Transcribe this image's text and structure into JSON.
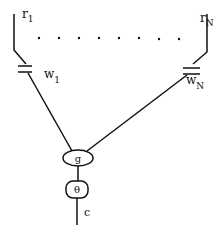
{
  "diagram": {
    "inputs": [
      {
        "label": "r",
        "subscript": "1"
      },
      {
        "label": "r",
        "subscript": "N"
      }
    ],
    "weights": [
      {
        "label": "w",
        "subscript": "1"
      },
      {
        "label": "w",
        "subscript": "N"
      }
    ],
    "ellipsis_dots": 8,
    "sum_node": {
      "label": "g"
    },
    "threshold_node": {
      "label": "θ"
    },
    "output": {
      "label": "c"
    },
    "colors": {
      "line": "#111111",
      "background": "#ffffff"
    }
  }
}
